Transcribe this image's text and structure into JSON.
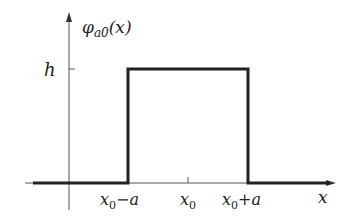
{
  "diagram": {
    "type": "rectangular-pulse",
    "y_axis_label": {
      "main": "φ",
      "sub": "a0",
      "arg": "(x)"
    },
    "x_axis_label": "x",
    "height_label": "h",
    "tick_labels": [
      {
        "main": "x",
        "sub": "0",
        "suffix": "−a"
      },
      {
        "main": "x",
        "sub": "0",
        "suffix": ""
      },
      {
        "main": "x",
        "sub": "0",
        "suffix": "+a"
      }
    ],
    "colors": {
      "axis": "#555555",
      "pulse": "#222222"
    }
  }
}
